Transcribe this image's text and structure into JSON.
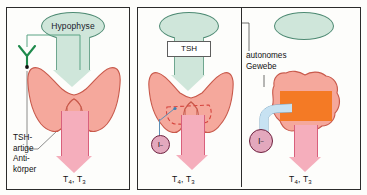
{
  "figure": {
    "panel_count": 3
  },
  "colors": {
    "pituitary_fill": "#cfe6da",
    "pituitary_stroke": "#4e8a73",
    "signal_arrow_fill": "#cfe6da",
    "signal_arrow_stroke": "#6fa68f",
    "thyroid_fill": "#f5a89c",
    "thyroid_stroke": "#c8594b",
    "hormone_arrow_fill": "#f5aebc",
    "hormone_arrow_stroke": "#d8607c",
    "autonomous_tissue_fill": "#f47a25",
    "iodide_fill": "#e3a8bd",
    "iodide_stroke": "#6e2340",
    "iodide_tube_fill": "#c7e2f2",
    "antibody_stroke": "#1f8a4c",
    "dashed_region_stroke": "#d6463f",
    "frame_stroke": "#2b2b2b",
    "leader_stroke": "#4a4a4a"
  },
  "panel_1": {
    "name": "tsh-like-antibody-stimulation",
    "pituitary_label": "Hypophyse",
    "antibody_label": "TSH-\nartige\nAnti-\nkörper",
    "hormone_output": "T4, T3",
    "hormone_output_parts": {
      "t4": "T",
      "t4_sub": "4",
      "sep": ", ",
      "t3": "T",
      "t3_sub": "3"
    }
  },
  "panel_2": {
    "name": "normal-tsh-regulation",
    "pituitary_label": "",
    "signal_box_label": "TSH",
    "iodide_label": "I",
    "iodide_charge": "−",
    "hormone_output": "T4, T3",
    "hormone_output_parts": {
      "t4": "T",
      "t4_sub": "4",
      "sep": ", ",
      "t3": "T",
      "t3_sub": "3"
    }
  },
  "panel_3": {
    "name": "autonomous-tissue",
    "pituitary_label": "",
    "tissue_label": "autonomes\nGewebe",
    "iodide_label": "I",
    "iodide_charge": "−",
    "hormone_output": "T4, T3",
    "hormone_output_parts": {
      "t4": "T",
      "t4_sub": "4",
      "sep": ", ",
      "t3": "T",
      "t3_sub": "3"
    }
  },
  "icons": {
    "antibody": "y-shaped-antibody-icon",
    "thyroid": "thyroid-gland-icon",
    "pituitary": "pituitary-ellipse-icon",
    "down_arrow_signal": "down-arrow-icon",
    "down_arrow_hormone": "down-arrow-icon",
    "iodide": "iodide-circle-icon"
  }
}
